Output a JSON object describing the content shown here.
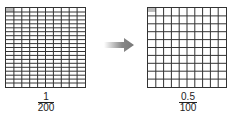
{
  "left_grid": {
    "rows": 20,
    "cols": 10,
    "shaded_cells": 1,
    "fraction": {
      "numerator": "1",
      "denominator": "200"
    }
  },
  "right_grid": {
    "rows": 10,
    "cols": 10,
    "shaded_cells": 0.5,
    "fraction": {
      "numerator": "0.5",
      "denominator": "100"
    }
  },
  "arrow": {
    "icon": "arrow-right-icon",
    "color": "#888888"
  },
  "colors": {
    "grid_line": "#333333",
    "shade": "#bbbbbb"
  }
}
